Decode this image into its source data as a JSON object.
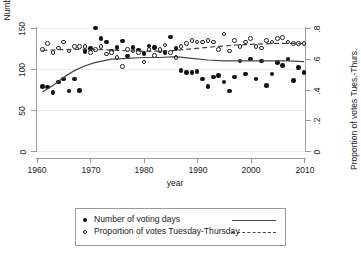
{
  "chart_data": {
    "type": "scatter",
    "title": "",
    "xlabel": "year",
    "ylabel": "Number of voting days",
    "ylabel_right": "Proportion of votes Tues.-Thurs.",
    "xlim": [
      1960,
      2010
    ],
    "ylim": [
      0,
      150
    ],
    "ylim_right": [
      0,
      0.8
    ],
    "xticks": [
      1960,
      1970,
      1980,
      1990,
      2000,
      2010
    ],
    "yticks_left": [
      0,
      50,
      100,
      150
    ],
    "yticks_right": [
      "0",
      ".2",
      ".4",
      ".6",
      ".8"
    ],
    "grid": true,
    "legend_position": "below-axes",
    "legend": [
      {
        "label": "Number of voting days",
        "marker": "filled-circle",
        "line": "solid"
      },
      {
        "label": "Proportion of votes Tuesday-Thursday",
        "marker": "open-circle",
        "line": "dashed"
      }
    ],
    "series": [
      {
        "name": "Number of voting days",
        "axis": "left",
        "marker": "filled-circle",
        "points": [
          [
            1961,
            79
          ],
          [
            1962,
            78
          ],
          [
            1963,
            71
          ],
          [
            1964,
            84
          ],
          [
            1965,
            88
          ],
          [
            1966,
            73
          ],
          [
            1967,
            88
          ],
          [
            1968,
            74
          ],
          [
            1969,
            121
          ],
          [
            1970,
            125
          ],
          [
            1971,
            150
          ],
          [
            1972,
            137
          ],
          [
            1973,
            133
          ],
          [
            1974,
            122
          ],
          [
            1975,
            126
          ],
          [
            1976,
            134
          ],
          [
            1977,
            116
          ],
          [
            1978,
            126
          ],
          [
            1979,
            123
          ],
          [
            1980,
            119
          ],
          [
            1981,
            128
          ],
          [
            1982,
            126
          ],
          [
            1983,
            122
          ],
          [
            1984,
            120
          ],
          [
            1985,
            139
          ],
          [
            1986,
            125
          ],
          [
            1987,
            98
          ],
          [
            1988,
            96
          ],
          [
            1989,
            96
          ],
          [
            1990,
            97
          ],
          [
            1991,
            88
          ],
          [
            1992,
            79
          ],
          [
            1993,
            90
          ],
          [
            1994,
            92
          ],
          [
            1995,
            84
          ],
          [
            1996,
            73
          ],
          [
            1997,
            90
          ],
          [
            1998,
            110
          ],
          [
            1999,
            94
          ],
          [
            2000,
            112
          ],
          [
            2001,
            88
          ],
          [
            2002,
            110
          ],
          [
            2003,
            80
          ],
          [
            2004,
            94
          ],
          [
            2005,
            108
          ],
          [
            2006,
            104
          ],
          [
            2007,
            112
          ],
          [
            2008,
            86
          ],
          [
            2009,
            102
          ],
          [
            2010,
            96
          ]
        ]
      },
      {
        "name": "Proportion of votes Tuesday-Thursday",
        "axis": "right",
        "marker": "open-circle",
        "points": [
          [
            1961,
            0.66
          ],
          [
            1962,
            0.7
          ],
          [
            1963,
            0.64
          ],
          [
            1964,
            0.67
          ],
          [
            1965,
            0.71
          ],
          [
            1966,
            0.65
          ],
          [
            1967,
            0.68
          ],
          [
            1968,
            0.68
          ],
          [
            1969,
            0.68
          ],
          [
            1970,
            0.64
          ],
          [
            1971,
            0.66
          ],
          [
            1972,
            0.68
          ],
          [
            1973,
            0.63
          ],
          [
            1974,
            0.64
          ],
          [
            1975,
            0.61
          ],
          [
            1976,
            0.55
          ],
          [
            1977,
            0.66
          ],
          [
            1978,
            0.65
          ],
          [
            1979,
            0.64
          ],
          [
            1980,
            0.58
          ],
          [
            1981,
            0.66
          ],
          [
            1982,
            0.62
          ],
          [
            1983,
            0.66
          ],
          [
            1984,
            0.69
          ],
          [
            1985,
            0.64
          ],
          [
            1986,
            0.61
          ],
          [
            1987,
            0.68
          ],
          [
            1988,
            0.7
          ],
          [
            1989,
            0.72
          ],
          [
            1990,
            0.71
          ],
          [
            1991,
            0.71
          ],
          [
            1992,
            0.72
          ],
          [
            1993,
            0.71
          ],
          [
            1994,
            0.66
          ],
          [
            1995,
            0.76
          ],
          [
            1996,
            0.65
          ],
          [
            1997,
            0.72
          ],
          [
            1998,
            0.68
          ],
          [
            1999,
            0.71
          ],
          [
            2000,
            0.73
          ],
          [
            2001,
            0.68
          ],
          [
            2002,
            0.67
          ],
          [
            2003,
            0.72
          ],
          [
            2004,
            0.71
          ],
          [
            2005,
            0.73
          ],
          [
            2006,
            0.74
          ],
          [
            2007,
            0.71
          ],
          [
            2008,
            0.7
          ],
          [
            2009,
            0.7
          ],
          [
            2010,
            0.7
          ]
        ]
      }
    ],
    "trend_lines": [
      {
        "name": "Number of voting days trend",
        "axis": "left",
        "style": "solid",
        "points": [
          [
            1961,
            72
          ],
          [
            1963,
            80
          ],
          [
            1965,
            90
          ],
          [
            1967,
            98
          ],
          [
            1969,
            104
          ],
          [
            1971,
            108
          ],
          [
            1974,
            112
          ],
          [
            1977,
            113
          ],
          [
            1980,
            114
          ],
          [
            1983,
            114
          ],
          [
            1986,
            115
          ],
          [
            1989,
            113
          ],
          [
            1992,
            111
          ],
          [
            1995,
            110
          ],
          [
            1998,
            110
          ],
          [
            2001,
            110
          ],
          [
            2004,
            110
          ],
          [
            2007,
            110
          ],
          [
            2010,
            109
          ]
        ]
      },
      {
        "name": "Proportion of votes trend",
        "axis": "right",
        "style": "dashed",
        "points": [
          [
            1961,
            0.655
          ],
          [
            1965,
            0.66
          ],
          [
            1969,
            0.662
          ],
          [
            1973,
            0.658
          ],
          [
            1977,
            0.652
          ],
          [
            1981,
            0.648
          ],
          [
            1985,
            0.652
          ],
          [
            1989,
            0.665
          ],
          [
            1993,
            0.678
          ],
          [
            1997,
            0.688
          ],
          [
            2001,
            0.695
          ],
          [
            2005,
            0.7
          ],
          [
            2008,
            0.7
          ],
          [
            2010,
            0.698
          ]
        ]
      }
    ]
  },
  "axes": {
    "x_label": "year",
    "y_left_label": "Number of voting days",
    "y_right_label": "Proportion of votes Tues.-Thurs.",
    "x_ticks": [
      "1960",
      "1970",
      "1980",
      "1990",
      "2000",
      "2010"
    ],
    "y_left_ticks": [
      "0",
      "50",
      "100",
      "150"
    ],
    "y_right_ticks": [
      "0",
      ".2",
      ".4",
      ".6",
      ".8"
    ]
  },
  "legend": {
    "item1_label": "Number of voting days",
    "item2_label": "Proportion of votes Tuesday-Thursday"
  }
}
